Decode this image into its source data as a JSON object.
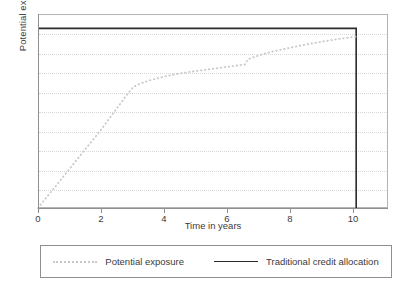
{
  "chart_data": {
    "type": "line",
    "title": "",
    "xlabel": "Time in years",
    "ylabel": "Potential exposure",
    "xlim": [
      0,
      11
    ],
    "xticks": [
      0,
      2,
      4,
      6,
      8,
      10
    ],
    "xticklabels": [
      "0",
      "2",
      "4",
      "6",
      "8",
      "10"
    ],
    "ylim": [
      0,
      1.08
    ],
    "yticks": [],
    "yticklabels": [],
    "grid": "horizontal-dotted",
    "legend_position": "below-center",
    "series": [
      {
        "name": "Potential exposure",
        "style": "dotted",
        "color": "#c9c9c9",
        "x": [
          0,
          0.25,
          0.5,
          0.75,
          1,
          1.25,
          1.5,
          1.75,
          2,
          2.25,
          2.5,
          2.75,
          3,
          3.25,
          3.5,
          3.75,
          4,
          4.25,
          4.5,
          4.75,
          5,
          5.25,
          5.5,
          5.75,
          6,
          6.25,
          6.5,
          6.6,
          6.85,
          7.1,
          7.4,
          7.7,
          8,
          8.3,
          8.6,
          8.9,
          9.2,
          9.5,
          9.75,
          10
        ],
        "y": [
          0.0,
          0.055,
          0.11,
          0.165,
          0.22,
          0.275,
          0.33,
          0.385,
          0.44,
          0.5,
          0.56,
          0.62,
          0.675,
          0.695,
          0.71,
          0.722,
          0.733,
          0.742,
          0.75,
          0.757,
          0.763,
          0.769,
          0.775,
          0.781,
          0.787,
          0.793,
          0.799,
          0.828,
          0.844,
          0.858,
          0.872,
          0.884,
          0.895,
          0.906,
          0.916,
          0.925,
          0.934,
          0.942,
          0.948,
          0.955
        ]
      },
      {
        "name": "Traditional credit allocation",
        "style": "solid",
        "color": "#2b2b2b",
        "x": [
          0,
          10,
          10
        ],
        "y": [
          1.0,
          1.0,
          0.0
        ]
      }
    ],
    "legend": [
      {
        "label": "Potential exposure",
        "style": "dotted",
        "color": "#c9c9c9"
      },
      {
        "label": "Traditional credit allocation",
        "style": "solid",
        "color": "#2b2b2b"
      }
    ],
    "gridline_count": 9
  },
  "axes": {
    "ylabel": "Potential exposure",
    "xlabel": "Time in years",
    "tick_0": "0",
    "tick_2": "2",
    "tick_4": "4",
    "tick_6": "6",
    "tick_8": "8",
    "tick_10": "10"
  },
  "legend": {
    "entry_0_label": "Potential exposure",
    "entry_1_label": "Traditional credit allocation"
  }
}
